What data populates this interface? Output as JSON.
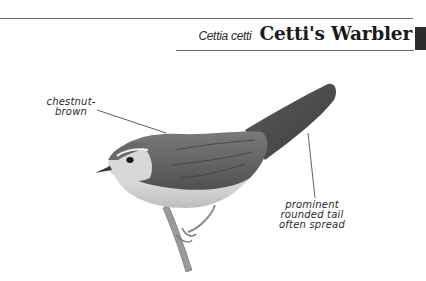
{
  "header": {
    "scientific_name": "Cettia cetti",
    "common_name": "Cetti's Warbler"
  },
  "illustration": {
    "subject": "Cetti's Warbler perched on a twig",
    "annotations": [
      {
        "id": "chestnut",
        "lines": [
          "chestnut-",
          "brown"
        ]
      },
      {
        "id": "tail",
        "lines": [
          "prominent",
          "rounded tail",
          "often spread"
        ]
      }
    ]
  },
  "colors": {
    "rule": "#6a6a6a",
    "tab": "#2b2b2b",
    "text": "#1a1a1a"
  }
}
